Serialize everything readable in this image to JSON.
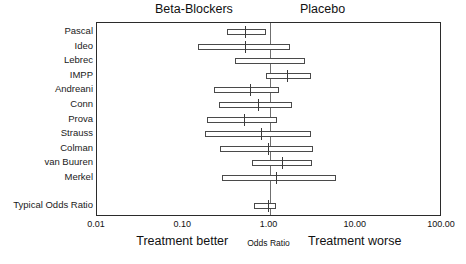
{
  "chart_data": {
    "type": "forest",
    "title": "",
    "xlabel": "Odds Ratio",
    "ylabel": "",
    "xscale": "log",
    "xlim": [
      0.01,
      100.0
    ],
    "grid": false,
    "null_value": 1.0,
    "tick_labels": [
      "0.01",
      "0.10",
      "1.00",
      "10.00",
      "100.00"
    ],
    "tick_values": [
      0.01,
      0.1,
      1.0,
      10.0,
      100.0
    ],
    "group_headers": {
      "treatment": "Beta-Blockers",
      "control": "Placebo"
    },
    "axis_captions": {
      "left": "Treatment better",
      "center": "Odds Ratio",
      "right": "Treatment worse"
    },
    "rows": [
      {
        "label": "Pascal",
        "or": 0.52,
        "lo": 0.32,
        "hi": 0.91,
        "summary": false
      },
      {
        "label": "Ideo",
        "or": 0.52,
        "lo": 0.15,
        "hi": 1.74,
        "summary": false
      },
      {
        "label": "Lebrec",
        "or": null,
        "lo": 0.4,
        "hi": 2.55,
        "summary": false
      },
      {
        "label": "IMPP",
        "or": 1.58,
        "lo": 0.91,
        "hi": 3.05,
        "summary": false
      },
      {
        "label": "Andreani",
        "or": 0.6,
        "lo": 0.23,
        "hi": 1.3,
        "summary": false
      },
      {
        "label": "Conn",
        "or": 0.73,
        "lo": 0.26,
        "hi": 1.83,
        "summary": false
      },
      {
        "label": "Prova",
        "or": 0.5,
        "lo": 0.19,
        "hi": 1.22,
        "summary": false
      },
      {
        "label": "Strauss",
        "or": 0.79,
        "lo": 0.18,
        "hi": 3.05,
        "summary": false
      },
      {
        "label": "Colman",
        "or": 0.95,
        "lo": 0.27,
        "hi": 3.2,
        "summary": false
      },
      {
        "label": "van Buuren",
        "or": 1.4,
        "lo": 0.63,
        "hi": 3.1,
        "summary": false
      },
      {
        "label": "Merkel",
        "or": 1.2,
        "lo": 0.28,
        "hi": 5.9,
        "summary": false
      },
      {
        "label": "Typical Odds Ratio",
        "or": 0.97,
        "lo": 0.67,
        "hi": 1.18,
        "summary": true
      }
    ]
  },
  "colors": {
    "frame": "#2b2b2b",
    "null_line": "#6f6f6f",
    "bar_stroke": "#4a4a4a",
    "bar_fill": "#ffffff",
    "text": "#1a1a1a",
    "background": "#ffffff"
  }
}
